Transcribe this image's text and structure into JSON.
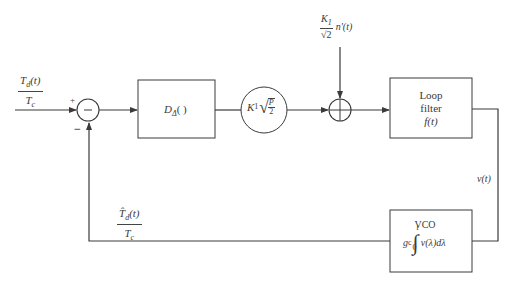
{
  "diagram": {
    "type": "block-diagram",
    "colors": {
      "line": "#3a3a3a",
      "background": "#ffffff"
    },
    "input": {
      "numerator": "T",
      "numerator_sub": "d",
      "numerator_arg": "(t)",
      "denominator": "T",
      "denominator_sub": "c"
    },
    "summing_junction_1": {
      "symbol": "−",
      "plus_sign": "+",
      "minus_sign": "−"
    },
    "discriminator_block": {
      "label": "D",
      "label_sub": "Δ",
      "label_arg": "( )"
    },
    "gain_block": {
      "label": "K",
      "label_sub": "1",
      "sqrt_num": "P",
      "sqrt_den": "2"
    },
    "noise_input": {
      "numerator": "K",
      "numerator_sub": "1",
      "denominator": "√2",
      "suffix": "n′(t)"
    },
    "summing_junction_2": {
      "symbol": "+"
    },
    "loop_filter_block": {
      "line1": "Loop",
      "line2": "filter",
      "line3": "f(t)"
    },
    "output_signal": {
      "label": "v(t)"
    },
    "vco_block": {
      "title": "VCO",
      "gain": "g",
      "gain_sub": "c",
      "integral_upper": "t",
      "integral_lower": "0",
      "integrand": "v(λ)dλ"
    },
    "feedback": {
      "numerator": "T̂",
      "numerator_sub": "d",
      "numerator_arg": "(t)",
      "denominator": "T",
      "denominator_sub": "c"
    }
  }
}
